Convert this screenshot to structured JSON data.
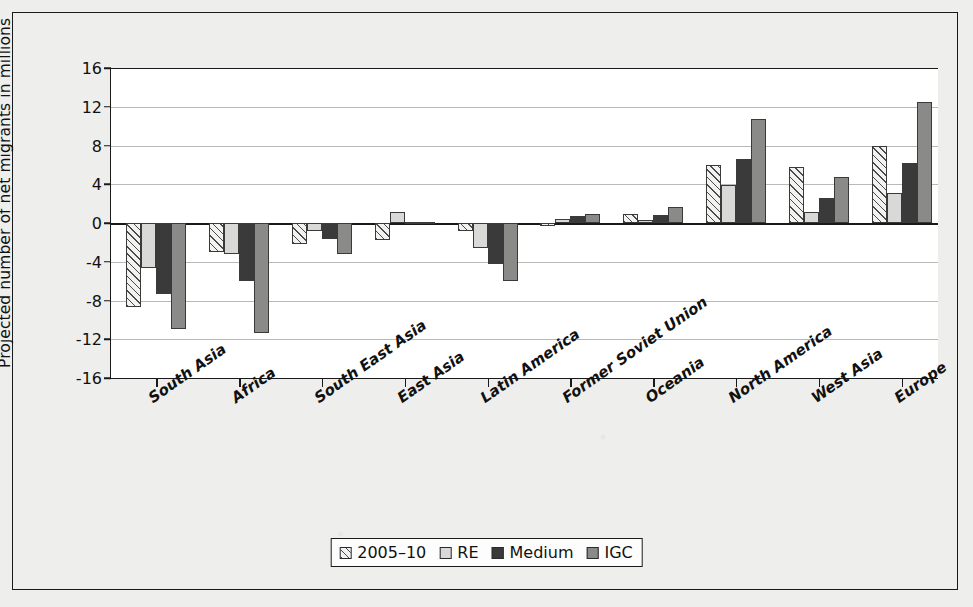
{
  "chart_data": {
    "type": "bar",
    "title": "",
    "subtitle": "",
    "xlabel": "",
    "ylabel": "Projected number of net migrants in millions",
    "ylim": [
      -16,
      16
    ],
    "yticks": [
      16,
      12,
      8,
      4,
      0,
      -4,
      -8,
      -12,
      -16
    ],
    "ytick_labels": [
      "16",
      "12",
      "8",
      "4",
      "0",
      "-4",
      "-8",
      "-12",
      "-16"
    ],
    "grid": true,
    "legend_position": "bottom",
    "categories": [
      "South Asia",
      "Africa",
      "South East Asia",
      "East Asia",
      "Latin America",
      "Former Soviet Union",
      "Oceania",
      "North America",
      "West Asia",
      "Europe"
    ],
    "series": [
      {
        "name": "2005–10",
        "swatch": "hatched",
        "color": "#f2f2f0",
        "values": [
          -8.7,
          -3.0,
          -2.2,
          -1.8,
          -0.8,
          -0.3,
          0.9,
          6.0,
          5.8,
          8.0
        ]
      },
      {
        "name": "RE",
        "swatch": "light-gray",
        "color": "#d9d9d7",
        "values": [
          -4.6,
          -3.2,
          -0.8,
          1.1,
          -2.6,
          0.4,
          0.3,
          3.9,
          1.1,
          3.1
        ]
      },
      {
        "name": "Medium",
        "swatch": "dark",
        "color": "#3a3a3a",
        "values": [
          -7.3,
          -6.0,
          -1.6,
          0.1,
          -4.2,
          0.7,
          0.8,
          6.6,
          2.6,
          6.2
        ]
      },
      {
        "name": "IGC",
        "swatch": "mid-gray",
        "color": "#8a8a88",
        "values": [
          -10.9,
          -11.4,
          -3.2,
          0.1,
          -6.0,
          0.9,
          1.7,
          10.7,
          4.8,
          12.5
        ]
      }
    ]
  },
  "legend": {
    "items": [
      {
        "label": "2005–10"
      },
      {
        "label": "RE"
      },
      {
        "label": "Medium"
      },
      {
        "label": "IGC"
      }
    ]
  }
}
